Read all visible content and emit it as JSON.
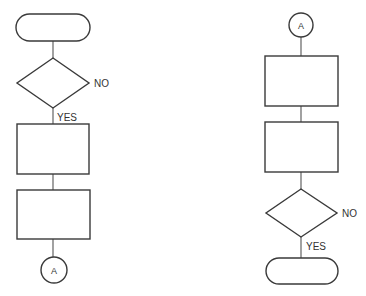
{
  "diagram": {
    "type": "flowchart",
    "colors": {
      "stroke": "#3a3a3a",
      "background": "#ffffff",
      "text": "#333333"
    },
    "left_chart": {
      "nodes": [
        {
          "id": "start-terminal",
          "shape": "terminal",
          "text": ""
        },
        {
          "id": "decision",
          "shape": "diamond",
          "text": ""
        },
        {
          "id": "process-1",
          "shape": "rectangle",
          "text": ""
        },
        {
          "id": "process-2",
          "shape": "rectangle",
          "text": ""
        },
        {
          "id": "connector",
          "shape": "circle",
          "text": "A"
        }
      ],
      "labels": {
        "no": "NO",
        "yes": "YES"
      }
    },
    "right_chart": {
      "nodes": [
        {
          "id": "connector",
          "shape": "circle",
          "text": "A"
        },
        {
          "id": "process-1",
          "shape": "rectangle",
          "text": ""
        },
        {
          "id": "process-2",
          "shape": "rectangle",
          "text": ""
        },
        {
          "id": "decision",
          "shape": "diamond",
          "text": ""
        },
        {
          "id": "end-terminal",
          "shape": "terminal",
          "text": ""
        }
      ],
      "labels": {
        "no": "NO",
        "yes": "YES"
      }
    }
  }
}
